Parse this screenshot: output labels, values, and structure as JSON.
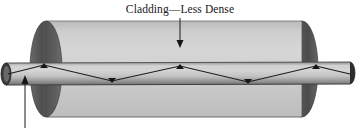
{
  "figure": {
    "title_label": "Cladding—Less Dense",
    "core_label": ""
  },
  "labels": {
    "cladding": {
      "text": "Cladding—Less Dense",
      "x": 180,
      "y": 12
    }
  },
  "annotations": [
    {
      "name": "cladding-pointer-arrow",
      "direction": "down",
      "x1": 180,
      "y1": 17,
      "x2": 180,
      "y2": 46
    },
    {
      "name": "core-pointer-arrow",
      "direction": "up",
      "x1": 25,
      "y1": 128,
      "x2": 25,
      "y2": 77
    }
  ],
  "colors": {
    "cladding_body": "#c9c9c9",
    "cladding_body_light": "#d4d4d4",
    "cladding_end_cap_dark": "#555555",
    "cladding_end_cap_shadow": "#4a4a4a",
    "core_tube_light": "#cccccc",
    "core_tube_mid": "#a8a8a8",
    "core_tube_dark": "#6e6e6e",
    "core_opening_dark": "#2a2a2a",
    "ray_line": "#1b1b1b",
    "outline": "#2b2b2b",
    "text": "#17161a",
    "background": "#ffffff"
  },
  "geometry": {
    "cladding": {
      "left_cap_center_x": 46,
      "right_cap_center_x": 302,
      "cap_rx": 16,
      "cap_ry": 48,
      "top_y": 21,
      "bottom_y": 117
    },
    "core_tube": {
      "left_x": 3,
      "right_x": 353,
      "top_y": 62,
      "bottom_y": 84,
      "cap_rx": 5,
      "cap_ry": 11
    }
  },
  "ray_path": {
    "name": "total-internal-reflection-ray",
    "points": [
      {
        "x": 8,
        "y": 74
      },
      {
        "x": 44,
        "y": 65
      },
      {
        "x": 112,
        "y": 81
      },
      {
        "x": 180,
        "y": 66
      },
      {
        "x": 248,
        "y": 82
      },
      {
        "x": 316,
        "y": 66
      },
      {
        "x": 350,
        "y": 74
      }
    ],
    "bounce_markers": [
      {
        "x": 44,
        "y": 65
      },
      {
        "x": 112,
        "y": 81
      },
      {
        "x": 180,
        "y": 66
      },
      {
        "x": 248,
        "y": 82
      },
      {
        "x": 316,
        "y": 66
      }
    ]
  }
}
